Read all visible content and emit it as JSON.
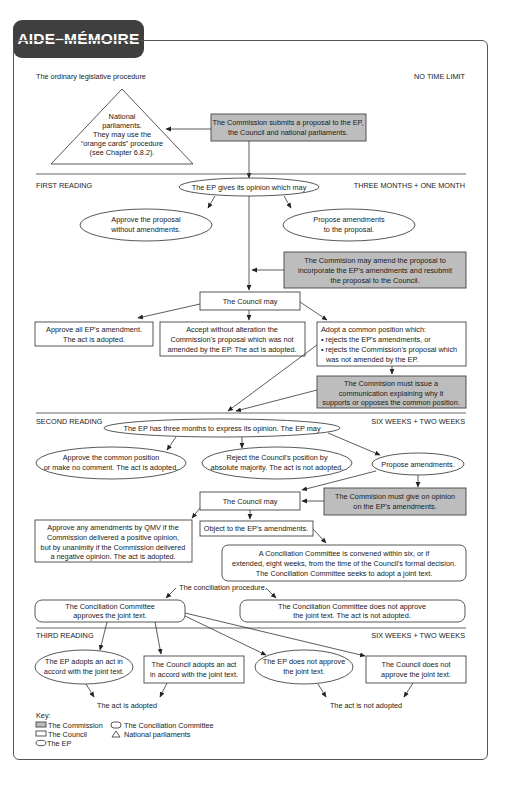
{
  "badge": {
    "title": "AIDE–MÉMOIRE"
  },
  "header": {
    "title": "The ordinary legislative procedure",
    "time": "NO TIME LIMIT"
  },
  "triangle": {
    "lines": [
      "National",
      "parliaments.",
      "They may use the",
      "“orange cards” procedure",
      "(see Chapter 6.8.2)."
    ]
  },
  "commission_submits": {
    "lines": [
      "The Commission submits a proposal to the EP,",
      "the Council and national parliaments."
    ]
  },
  "first_reading": {
    "label": "FIRST READING",
    "time": "THREE MONTHS + ONE MONTH",
    "ep_opinion": "The EP gives its opinion which may",
    "approve": [
      "Approve the proposal",
      "without amendments."
    ],
    "propose": [
      "Propose amendments",
      "to the proposal."
    ],
    "commission_amend": [
      "The Commision may amend the proposal to",
      "incorporate the EP's amendments and resubmit",
      "the proposal to the Council."
    ],
    "council_may": "The Council may",
    "approve_all": [
      "Approve all EP's amendment.",
      "The act is adopted."
    ],
    "accept": [
      "Accept without alteration the",
      "Commission's proposal which was not",
      "amended by the EP. The act is adopted."
    ],
    "common_position": [
      "Adopt a common position which:",
      "• rejects the EP's amendments, or",
      "• rejects the Commission's proposal which",
      "   was not amended by the EP."
    ],
    "communication": [
      "The Commision must issue a",
      "communication explaining why it",
      "supports or opposes the common position."
    ]
  },
  "second_reading": {
    "label": "SECOND READING",
    "time": "SIX WEEKS + TWO WEEKS",
    "ep_three_months": "The EP has three months to express its opinion. The EP may",
    "approve_common": [
      "Approve the common position",
      "or make no comment. The act is adopted."
    ],
    "reject": [
      "Reject the Council's position by",
      "absolute majority. The act is not adopted."
    ],
    "propose": "Propose amendments.",
    "council_may": "The Council may",
    "commission_opinion": [
      "The Commision must give on opinion",
      "on the EP's amendments."
    ],
    "approve_qmv": [
      "Approve any amendments by QMV if the",
      "Commission delivered a positive opinion,",
      "but by unanimity if the Commission delivered",
      "a negative opinion. The act is adopted."
    ],
    "object": "Object to the EP's amendments.",
    "conciliation_convened": [
      "A Conciliation Committee is convened within six, or if",
      "extended, eight weeks, from the time of the Council's formal decision.",
      "The Conciliation Committee seeks to adopt a joint text."
    ],
    "conciliation_procedure": "The conciliation procedure.",
    "cc_approves": [
      "The Conciliation Committee",
      "approves the joint text."
    ],
    "cc_not_approve": [
      "The Conciliation Committee does not approve",
      "the joint text. The act is not adopted."
    ]
  },
  "third_reading": {
    "label": "THIRD READING",
    "time": "SIX WEEKS + TWO WEEKS",
    "ep_adopts": [
      "The EP adopts an act in",
      "accord with the joint text."
    ],
    "council_adopts": [
      "The Council adopts an act",
      "in accord with the joint text."
    ],
    "ep_not_approve": [
      "The EP does not approve",
      "the joint text."
    ],
    "council_not_approve": [
      "The Council does not",
      "approve the joint text."
    ],
    "adopted": "The act is adopted",
    "not_adopted": "The act is not adopted"
  },
  "key": {
    "title": "Key:",
    "commission": "The Commission",
    "council": "The Council",
    "ep": "The EP",
    "conciliation": "The Conciliation Committee",
    "national": "National parliaments"
  },
  "colors": {
    "commission_fill": "#bdbdbd",
    "badge": "#3f3f3f",
    "stroke": "#444444"
  }
}
